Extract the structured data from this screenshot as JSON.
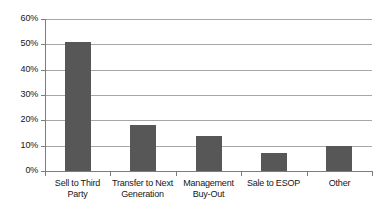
{
  "chart_data": {
    "type": "bar",
    "title": "",
    "subtitle": "",
    "xlabel": "",
    "ylabel": "",
    "categories": [
      "Sell to Third Party",
      "Transfer to Next Generation",
      "Management Buy-Out",
      "Sale to ESOP",
      "Other"
    ],
    "values": [
      51,
      18,
      14,
      7,
      10
    ],
    "value_labels": [
      "51%",
      "18%",
      "14%",
      "7%",
      "10%"
    ],
    "ylim": [
      0,
      60
    ],
    "ytick_values": [
      60,
      50,
      40,
      30,
      20,
      10,
      0
    ],
    "ytick_labels": [
      "60%",
      "50%",
      "40%",
      "30%",
      "20%",
      "10%",
      "0%"
    ],
    "grid": true,
    "grid_axis": "y",
    "legend": false,
    "legend_position": "none",
    "series": [
      {
        "name": "Exit strategy share",
        "values": [
          51,
          18,
          14,
          7,
          10
        ]
      }
    ]
  },
  "style": {
    "bar_color": "#575757",
    "gridline_color": "#a6a6a6",
    "axis_color": "#7d7d7d",
    "text_color": "#161616",
    "background_color": "#ffffff"
  }
}
